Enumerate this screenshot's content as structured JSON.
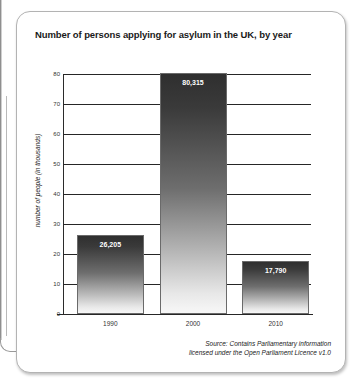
{
  "card": {
    "title": "Number of persons applying for asylum in the UK, by year"
  },
  "source": {
    "line1": "Source: Contains Parliamentary information",
    "line2": "licensed under the Open Parliament Licence v1.0"
  },
  "chart_data": {
    "type": "bar",
    "title": "Number of persons applying for asylum in the UK, by year",
    "xlabel": "",
    "ylabel": "number of people (in thousands)",
    "categories": [
      "1990",
      "2000",
      "2010"
    ],
    "values": [
      26.205,
      80.315,
      17.79
    ],
    "data_labels": [
      "26,205",
      "80,315",
      "17,790"
    ],
    "ylim": [
      0,
      80
    ],
    "yticks": [
      0,
      10,
      20,
      30,
      40,
      50,
      60,
      70,
      80
    ],
    "ytick_labels": [
      "0",
      "10",
      "20",
      "30",
      "40",
      "50",
      "60",
      "70",
      "80"
    ],
    "grid": true,
    "legend": false,
    "bar_fill": "#3a3a3a",
    "bar_fill_bottom": "#f7f7f7",
    "label_color": "#ffffff",
    "axis_color": "#262626"
  }
}
